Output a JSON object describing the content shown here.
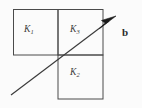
{
  "figure": {
    "title": "",
    "background_color": "#fbfbfb",
    "line_color": "#4a4a4a",
    "label_color": "#3d3d3d",
    "arrow_color": "#3a3a3a",
    "width": 142,
    "height": 108
  },
  "regions": [
    {
      "id": "k1",
      "base": "K",
      "subscript": "1",
      "label": "K₁",
      "rect": {
        "x": 13,
        "y": 9,
        "w": 45,
        "h": 46
      }
    },
    {
      "id": "k3",
      "base": "K",
      "subscript": "3",
      "label": "K₃",
      "rect": {
        "x": 58,
        "y": 9,
        "w": 45,
        "h": 46
      }
    },
    {
      "id": "k2",
      "base": "K",
      "subscript": "2",
      "label": "K₂",
      "rect": {
        "x": 58,
        "y": 55,
        "w": 45,
        "h": 44
      }
    }
  ],
  "vector": {
    "label": "b",
    "bold": true,
    "tail": {
      "x": 11,
      "y": 95
    },
    "tip": {
      "x": 116,
      "y": 16
    },
    "label_position": {
      "x": 122,
      "y": 27
    }
  }
}
